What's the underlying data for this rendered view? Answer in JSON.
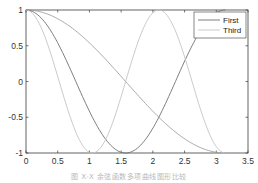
{
  "chart_data": {
    "type": "line",
    "title": "",
    "xlabel": "",
    "ylabel": "",
    "xlim": [
      0,
      3.5
    ],
    "ylim": [
      -1,
      1
    ],
    "grid": false,
    "legend_position": "upper right",
    "x_ticks": [
      0,
      0.5,
      1,
      1.5,
      2,
      2.5,
      3,
      3.5
    ],
    "x_tick_labels": [
      "0",
      "0.5",
      "1",
      "1.5",
      "2",
      "2.5",
      "3",
      "3.5"
    ],
    "y_ticks": [
      -1,
      -0.5,
      0,
      0.5,
      1
    ],
    "y_tick_labels": [
      "-1",
      "-0.5",
      "0",
      "0.5",
      "1"
    ],
    "x_range": [
      0,
      3.1416
    ],
    "series": [
      {
        "name": "cos(x)",
        "expr": "cos(1x)",
        "freq": 1,
        "color": "#a0a0a0",
        "legend": false,
        "x": [
          0,
          0.5,
          1,
          1.5,
          2,
          2.5,
          3,
          3.1416
        ],
        "values": [
          1,
          0.878,
          0.54,
          0.071,
          -0.416,
          -0.801,
          -0.99,
          -1
        ]
      },
      {
        "name": "First",
        "expr": "cos(2x)",
        "freq": 2,
        "color": "#707070",
        "legend": true,
        "x": [
          0,
          0.5,
          1,
          1.5,
          2,
          2.5,
          3,
          3.1416
        ],
        "values": [
          1,
          0.54,
          -0.416,
          -0.99,
          -0.654,
          0.284,
          0.96,
          1
        ]
      },
      {
        "name": "Third",
        "expr": "cos(3x)",
        "freq": 3,
        "color": "#c4c4c4",
        "legend": true,
        "x": [
          0,
          0.5,
          1,
          1.5,
          2,
          2.5,
          3,
          3.1416
        ],
        "values": [
          1,
          0.071,
          -0.99,
          -0.211,
          0.96,
          0.347,
          -0.911,
          -1
        ]
      }
    ]
  },
  "legend": {
    "items": [
      {
        "label": "First",
        "color": "#707070"
      },
      {
        "label": "Third",
        "color": "#c4c4c4"
      }
    ]
  },
  "caption": "图 X-X 余弦函数多项曲线图形比较"
}
